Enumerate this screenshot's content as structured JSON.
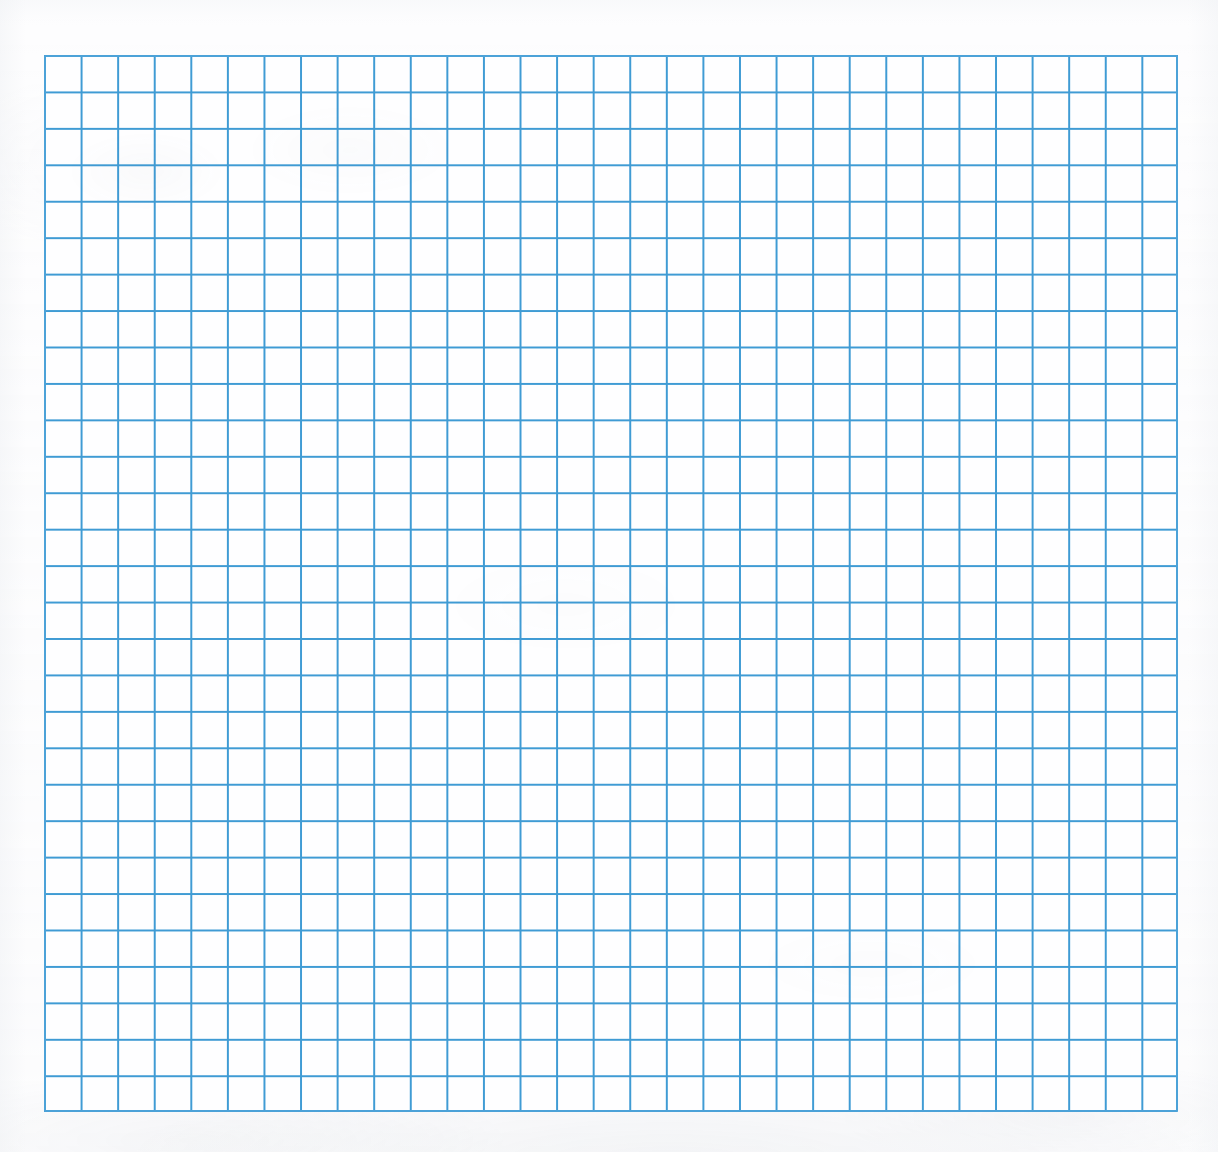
{
  "document": {
    "type": "scanned-graph-paper",
    "title": "Blank blue graph paper sheet"
  },
  "page": {
    "width_px": 1218,
    "height_px": 1152,
    "background_color": "#fdfdfe",
    "margin_color": "#fcfcfd"
  },
  "grid": {
    "left_px": 44,
    "top_px": 55,
    "right_px": 1178,
    "bottom_px": 1112,
    "width_px": 1134,
    "height_px": 1057,
    "columns": 31,
    "rows": 29,
    "cell_width_px": 36.6,
    "cell_height_px": 36.45,
    "line_color": "#3f9bd4",
    "line_color_soft": "#6fb9e2",
    "line_width_px": 1.6,
    "border_color": "#4ca2d8",
    "border_width_px": 2,
    "cell_fill_color": "#fefeff",
    "has_major_gridlines": false,
    "has_labels": false,
    "has_annotations": false,
    "content": ""
  },
  "chart_data": {
    "type": "table",
    "title": "",
    "subtitle": "",
    "xlabel": "",
    "ylabel": "",
    "grid": true,
    "legend_position": "none",
    "columns": 31,
    "rows": 29,
    "categories": [],
    "values": [],
    "series": [],
    "annotations": [],
    "note": "Blank graph paper — 31 columns by 29 rows of empty cells, no plotted data."
  }
}
